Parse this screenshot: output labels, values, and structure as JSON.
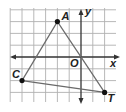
{
  "diagram": {
    "type": "coordinate-plane-triangle",
    "axes": {
      "x_label": "x",
      "y_label": "y",
      "origin_label": "O",
      "x_range": [
        -6,
        3
      ],
      "y_range": [
        -4,
        4
      ]
    },
    "grid": {
      "spacing_units": 1,
      "visible": true
    },
    "points": [
      {
        "label": "A",
        "x": -2,
        "y": 3
      },
      {
        "label": "C",
        "x": -5,
        "y": -2
      },
      {
        "label": "T",
        "x": 2,
        "y": -3
      }
    ],
    "segments": [
      [
        "A",
        "T"
      ],
      [
        "T",
        "C"
      ],
      [
        "C",
        "A"
      ]
    ],
    "colors": {
      "grid": "#b0b0b0",
      "axis": "#333333",
      "triangle": "#6a6a6a",
      "point": "#111111",
      "label": "#222222"
    }
  }
}
